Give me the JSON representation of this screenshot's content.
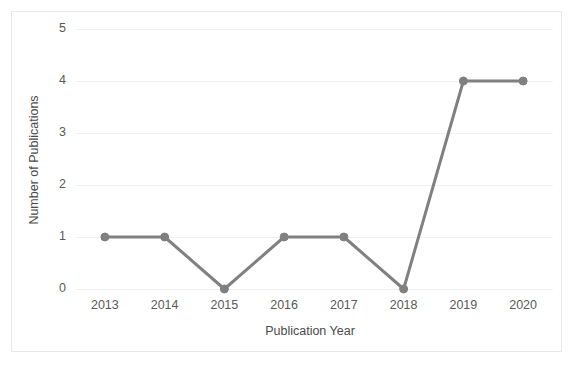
{
  "chart_data": {
    "type": "line",
    "title": "",
    "xlabel": "Publication Year",
    "ylabel": "Number of Publications",
    "categories": [
      "2013",
      "2014",
      "2015",
      "2016",
      "2017",
      "2018",
      "2019",
      "2020"
    ],
    "values": [
      1,
      1,
      0,
      1,
      1,
      0,
      4,
      4
    ],
    "x": [
      2013,
      2014,
      2015,
      2016,
      2017,
      2018,
      2019,
      2020
    ],
    "ylim": [
      0,
      5
    ],
    "yticks": [
      0,
      1,
      2,
      3,
      4,
      5
    ],
    "ytick_labels": [
      "0",
      "1",
      "2",
      "3",
      "4",
      "5"
    ],
    "grid": true,
    "grid_axis": "y",
    "legend": false,
    "legend_position": "none",
    "series": [
      {
        "name": "Number of Publications",
        "values": [
          1,
          1,
          0,
          1,
          1,
          0,
          4,
          4
        ],
        "color": "#808080",
        "marker": "circle",
        "line_width": 3
      }
    ]
  },
  "style": {
    "line_color": "#808080",
    "marker_color": "#808080",
    "grid_color": "#f1f1f1",
    "border_color": "#e8e8e8",
    "background": "#ffffff",
    "tick_label_color": "#595959",
    "axis_title_color": "#4a4a4a"
  },
  "axis_titles": {
    "x": "Publication Year",
    "y": "Number of Publications"
  }
}
